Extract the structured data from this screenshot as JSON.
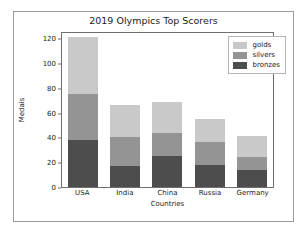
{
  "chart_data": {
    "type": "bar",
    "stacked": true,
    "title": "2019 Olympics Top Scorers",
    "xlabel": "Countries",
    "ylabel": "Medals",
    "categories": [
      "USA",
      "India",
      "China",
      "Russia",
      "Germany"
    ],
    "series": [
      {
        "name": "bronzes",
        "color": "#4d4d4d",
        "values": [
          38,
          17,
          25,
          18,
          14
        ]
      },
      {
        "name": "silvers",
        "color": "#949494",
        "values": [
          37,
          23,
          19,
          18,
          10
        ]
      },
      {
        "name": "golds",
        "color": "#c9c9c9",
        "values": [
          46,
          26,
          25,
          19,
          17
        ]
      }
    ],
    "totals": [
      121,
      66,
      69,
      55,
      41
    ],
    "ylim": [
      0,
      126
    ],
    "yticks": [
      0,
      20,
      40,
      60,
      80,
      100,
      120
    ],
    "ytick_labels": [
      "0",
      "20",
      "40",
      "60",
      "80",
      "100",
      "120"
    ],
    "grid": false,
    "legend_position": "upper right",
    "legend_entries": [
      "golds",
      "silvers",
      "bronzes"
    ]
  }
}
